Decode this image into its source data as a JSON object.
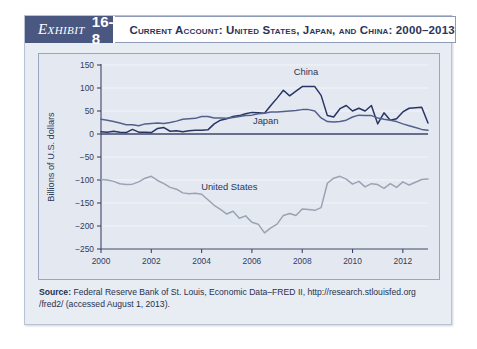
{
  "exhibit": {
    "label_word": "Exhibit",
    "label_number": "16-8",
    "title": "Current Account: United States, Japan, and China: 2000–2013"
  },
  "source": {
    "prefix": "Source:",
    "text": " Federal Reserve Bank of St. Louis, Economic Data–FRED II, http://research.stlouisfed.org /fred2/ (accessed August 1, 2013)."
  },
  "colors": {
    "header_band": "#4a5780",
    "card_bg": "#e8ecf3",
    "plot_bg": "#e4e9f1",
    "china": "#283464",
    "japan": "#53608c",
    "united_states": "#9aa3b4",
    "axis": "#3b4468",
    "grid": "#f2f5fa"
  },
  "chart_data": {
    "type": "line",
    "title": "Current Account: United States, Japan, and China: 2000–2013",
    "xlabel": "",
    "ylabel": "Billions of U.S. dollars",
    "xlim": [
      2000,
      2013
    ],
    "ylim": [
      -250,
      150
    ],
    "ytick_values": [
      150,
      100,
      50,
      0,
      -50,
      -100,
      -150,
      -200,
      -250
    ],
    "ytick_labels": [
      "150",
      "100",
      "50",
      "0",
      "−50",
      "−100",
      "−150",
      "−200",
      "−250"
    ],
    "xtick_values": [
      2000,
      2002,
      2004,
      2006,
      2008,
      2010,
      2012
    ],
    "xtick_labels": [
      "2000",
      "2002",
      "2004",
      "2006",
      "2008",
      "2010",
      "2012"
    ],
    "grid": "horizontal",
    "legend": "inline-labels",
    "annotations": [
      {
        "text": "China",
        "x": 2008.15,
        "y": 128
      },
      {
        "text": "Japan",
        "x": 2006.55,
        "y": 22
      },
      {
        "text": "United States",
        "x": 2005.1,
        "y": -122
      }
    ],
    "series": [
      {
        "name": "China",
        "color": "#283464",
        "x": [
          2000.0,
          2000.25,
          2000.5,
          2000.75,
          2001.0,
          2001.25,
          2001.5,
          2001.75,
          2002.0,
          2002.25,
          2002.5,
          2002.75,
          2003.0,
          2003.25,
          2003.5,
          2003.75,
          2004.0,
          2004.25,
          2004.5,
          2004.75,
          2005.0,
          2005.25,
          2005.5,
          2005.75,
          2006.0,
          2006.25,
          2006.5,
          2006.75,
          2007.0,
          2007.25,
          2007.5,
          2007.75,
          2008.0,
          2008.25,
          2008.5,
          2008.75,
          2009.0,
          2009.25,
          2009.5,
          2009.75,
          2010.0,
          2010.25,
          2010.5,
          2010.75,
          2011.0,
          2011.25,
          2011.5,
          2011.75,
          2012.0,
          2012.25,
          2012.5,
          2012.75,
          2013.0
        ],
        "y": [
          5,
          4,
          6,
          4,
          3,
          10,
          4,
          4,
          3,
          12,
          14,
          6,
          7,
          5,
          7,
          8,
          8,
          9,
          22,
          30,
          33,
          38,
          40,
          44,
          47,
          46,
          45,
          62,
          78,
          95,
          83,
          93,
          103,
          103,
          103,
          84,
          40,
          37,
          55,
          62,
          50,
          56,
          50,
          62,
          22,
          46,
          30,
          33,
          48,
          56,
          57,
          58,
          24
        ]
      },
      {
        "name": "Japan",
        "color": "#53608c",
        "x": [
          2000.0,
          2000.25,
          2000.5,
          2000.75,
          2001.0,
          2001.25,
          2001.5,
          2001.75,
          2002.0,
          2002.25,
          2002.5,
          2002.75,
          2003.0,
          2003.25,
          2003.5,
          2003.75,
          2004.0,
          2004.25,
          2004.5,
          2004.75,
          2005.0,
          2005.25,
          2005.5,
          2005.75,
          2006.0,
          2006.25,
          2006.5,
          2006.75,
          2007.0,
          2007.25,
          2007.5,
          2007.75,
          2008.0,
          2008.25,
          2008.5,
          2008.75,
          2009.0,
          2009.25,
          2009.5,
          2009.75,
          2010.0,
          2010.25,
          2010.5,
          2010.75,
          2011.0,
          2011.25,
          2011.5,
          2011.75,
          2012.0,
          2012.25,
          2012.5,
          2012.75,
          2013.0
        ],
        "y": [
          32,
          30,
          27,
          24,
          20,
          20,
          18,
          22,
          23,
          24,
          23,
          25,
          28,
          32,
          33,
          34,
          38,
          38,
          35,
          35,
          34,
          36,
          38,
          40,
          41,
          44,
          45,
          48,
          48,
          49,
          50,
          51,
          53,
          53,
          50,
          35,
          27,
          26,
          27,
          30,
          37,
          41,
          40,
          40,
          35,
          32,
          30,
          27,
          22,
          18,
          14,
          10,
          8
        ]
      },
      {
        "name": "United States",
        "color": "#9aa3b4",
        "x": [
          2000.0,
          2000.25,
          2000.5,
          2000.75,
          2001.0,
          2001.25,
          2001.5,
          2001.75,
          2002.0,
          2002.25,
          2002.5,
          2002.75,
          2003.0,
          2003.25,
          2003.5,
          2003.75,
          2004.0,
          2004.25,
          2004.5,
          2004.75,
          2005.0,
          2005.25,
          2005.5,
          2005.75,
          2006.0,
          2006.25,
          2006.5,
          2006.75,
          2007.0,
          2007.25,
          2007.5,
          2007.75,
          2008.0,
          2008.25,
          2008.5,
          2008.75,
          2009.0,
          2009.25,
          2009.5,
          2009.75,
          2010.0,
          2010.25,
          2010.5,
          2010.75,
          2011.0,
          2011.25,
          2011.5,
          2011.75,
          2012.0,
          2012.25,
          2012.5,
          2012.75,
          2013.0
        ],
        "y": [
          -99,
          -100,
          -103,
          -108,
          -110,
          -109,
          -104,
          -96,
          -92,
          -101,
          -108,
          -116,
          -120,
          -128,
          -130,
          -129,
          -131,
          -143,
          -155,
          -164,
          -174,
          -168,
          -183,
          -178,
          -192,
          -196,
          -215,
          -204,
          -196,
          -177,
          -173,
          -177,
          -163,
          -164,
          -166,
          -160,
          -107,
          -96,
          -92,
          -98,
          -109,
          -103,
          -115,
          -108,
          -110,
          -118,
          -108,
          -116,
          -104,
          -111,
          -105,
          -99,
          -98
        ]
      }
    ]
  }
}
